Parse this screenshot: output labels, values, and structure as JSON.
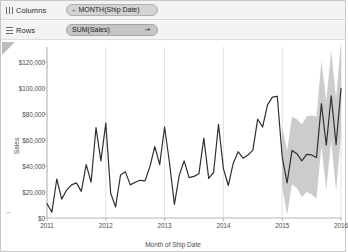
{
  "shelves": {
    "columns": {
      "label": "Columns",
      "icon": "columns-bars-icon",
      "pill": {
        "text": "MONTH(Ship Date)",
        "prefix": "+",
        "type": "dimension"
      }
    },
    "rows": {
      "label": "Rows",
      "icon": "rows-bars-icon",
      "pill": {
        "text": "SUM(Sales)",
        "badge": "forecast-indicator-icon",
        "badge_glyph": "➚",
        "type": "measure"
      }
    }
  },
  "chart_data": {
    "type": "line",
    "title": "",
    "xlabel": "Month of Ship Date",
    "ylabel": "Sales",
    "ylim": [
      0,
      130000
    ],
    "yticks": [
      0,
      20000,
      40000,
      60000,
      80000,
      100000,
      120000
    ],
    "ytick_labels": [
      "$0",
      "$20,000",
      "$40,000",
      "$60,000",
      "$80,000",
      "$100,000",
      "$120,000"
    ],
    "xlim": [
      "2011-01",
      "2016-01"
    ],
    "xticks": [
      "2011",
      "2012",
      "2013",
      "2014",
      "2015",
      "2016"
    ],
    "grid": {
      "vertical": true,
      "horizontal": false
    },
    "legend": "none",
    "line_color": "#31302f",
    "band_color": "#a3a3a3",
    "band_opacity": 0.55,
    "series": [
      {
        "name": "Actual Sales",
        "kind": "actual",
        "x": [
          "2011-01",
          "2011-02",
          "2011-03",
          "2011-04",
          "2011-05",
          "2011-06",
          "2011-07",
          "2011-08",
          "2011-09",
          "2011-10",
          "2011-11",
          "2011-12",
          "2012-01",
          "2012-02",
          "2012-03",
          "2012-04",
          "2012-05",
          "2012-06",
          "2012-07",
          "2012-08",
          "2012-09",
          "2012-10",
          "2012-11",
          "2012-12",
          "2013-01",
          "2013-02",
          "2013-03",
          "2013-04",
          "2013-05",
          "2013-06",
          "2013-07",
          "2013-08",
          "2013-09",
          "2013-10",
          "2013-11",
          "2013-12",
          "2014-01",
          "2014-02",
          "2014-03",
          "2014-04",
          "2014-05",
          "2014-06",
          "2014-07",
          "2014-08",
          "2014-09",
          "2014-10",
          "2014-11",
          "2014-12"
        ],
        "values": [
          11000,
          4500,
          30000,
          14500,
          21500,
          25500,
          27000,
          20500,
          41000,
          27500,
          69500,
          44000,
          73000,
          19000,
          8500,
          33000,
          35500,
          25500,
          27500,
          29000,
          28500,
          39500,
          55000,
          41000,
          70000,
          42500,
          10500,
          33000,
          44000,
          31000,
          32000,
          34000,
          61500,
          30500,
          35000,
          72000,
          38000,
          25000,
          42000,
          51000,
          46000,
          48500,
          52000,
          76000,
          70000,
          87000,
          93000,
          93500
        ]
      },
      {
        "name": "Forecast Sales",
        "kind": "forecast",
        "x": [
          "2015-01",
          "2015-02",
          "2015-03",
          "2015-04",
          "2015-05",
          "2015-06",
          "2015-07",
          "2015-08",
          "2015-09",
          "2015-10",
          "2015-11",
          "2015-12",
          "2016-01"
        ],
        "values": [
          47000,
          27000,
          52000,
          49500,
          44000,
          49000,
          48500,
          46500,
          88000,
          56000,
          94000,
          56500,
          99500
        ],
        "upper": [
          70000,
          52000,
          78000,
          76000,
          72000,
          78000,
          79000,
          78000,
          121000,
          90000,
          129000,
          92000,
          136000
        ],
        "lower": [
          24000,
          2500,
          26000,
          23000,
          16000,
          20000,
          18000,
          15000,
          55000,
          22000,
          59000,
          21000,
          63000
        ]
      }
    ]
  }
}
